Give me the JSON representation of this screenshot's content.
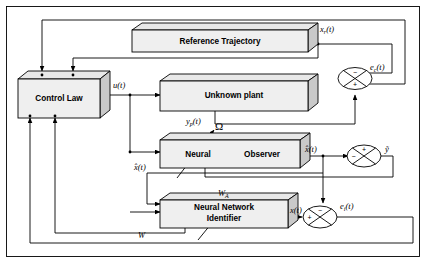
{
  "diagram": {
    "type": "block-diagram",
    "blocks": [
      {
        "id": "reference_trajectory",
        "label": "Reference Trajectory"
      },
      {
        "id": "control_law",
        "label": "Control Law"
      },
      {
        "id": "unknown_plant",
        "label": "Unknown plant"
      },
      {
        "id": "neural_observer_a",
        "label": "Neural"
      },
      {
        "id": "neural_observer_b",
        "label": "Observer"
      },
      {
        "id": "nn_identifier_l1",
        "label": "Neural  Network"
      },
      {
        "id": "nn_identifier_l2",
        "label": "Identifier"
      }
    ],
    "signals": {
      "reference_state": {
        "base": "x",
        "sub": "r",
        "arg": "(t)"
      },
      "control_input": {
        "base": "u",
        "sub": "",
        "arg": "(t)"
      },
      "plant_output": {
        "base": "y",
        "sub": "p",
        "arg": "(t)"
      },
      "observer_state": {
        "base": "x̂",
        "sub": "",
        "arg": "(t)"
      },
      "identifier_state": {
        "base": "x̂",
        "sub": "",
        "arg": "(t)"
      },
      "identifier_output": {
        "base": "x",
        "sub": "",
        "arg": "(t)"
      },
      "tracking_error": {
        "base": "e",
        "sub": "c",
        "arg": "(t)"
      },
      "identification_error": {
        "base": "e",
        "sub": "i",
        "arg": "(t)"
      },
      "output_error": {
        "base": "ỹ",
        "sub": "",
        "arg": ""
      },
      "observer_weights": {
        "base": "Ω",
        "sub": "",
        "arg": ""
      },
      "identifier_weights_a": {
        "base": "W",
        "sub": "A",
        "arg": ""
      },
      "identifier_weights": {
        "base": "W",
        "sub": "",
        "arg": ""
      }
    },
    "junctions": [
      {
        "id": "tracking-error-junction",
        "signs": {
          "top": "−",
          "bottom": "+"
        }
      },
      {
        "id": "output-error-junction",
        "signs": {
          "top": "+",
          "left": "−"
        }
      },
      {
        "id": "identification-error-junction",
        "signs": {
          "top": "−",
          "left": "+"
        }
      }
    ],
    "colors": {
      "block_face": "#efefef",
      "block_top": "#e8e8e8",
      "block_side": "#c9c9c9",
      "line": "#000000",
      "background": "#ffffff"
    }
  }
}
